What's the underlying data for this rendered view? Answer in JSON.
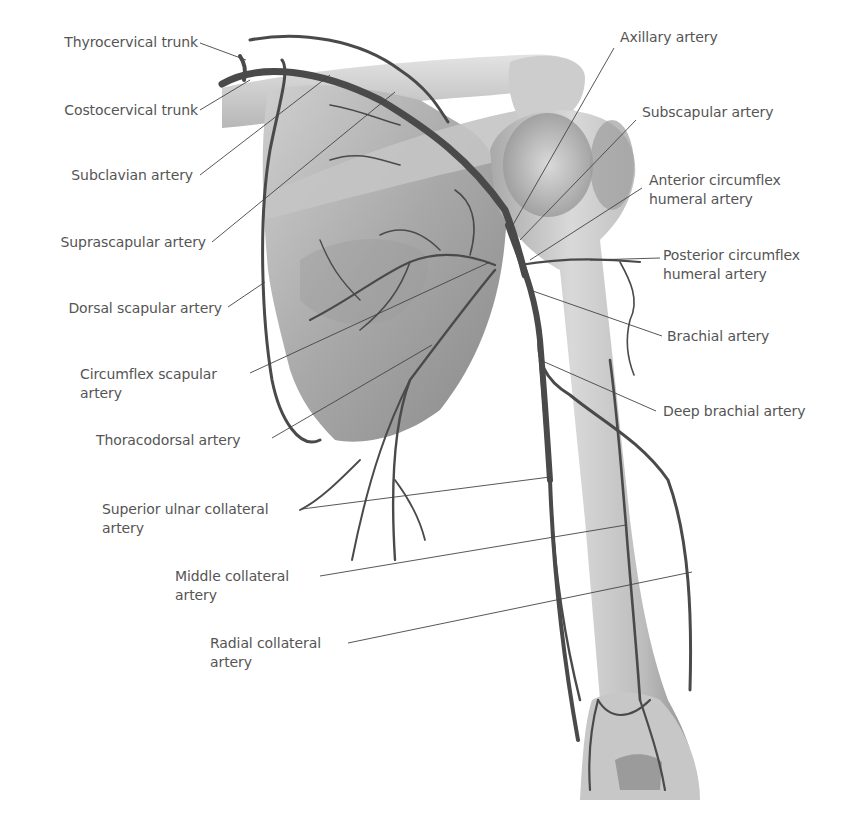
{
  "figure": {
    "colors": {
      "label_text": "#555555",
      "leader_line": "#444444",
      "artery": "#4a4a4a",
      "bone_light": "#d6d6d6",
      "bone_mid": "#b8b8b8",
      "bone_dark": "#8c8c8c",
      "background": "#ffffff"
    }
  },
  "labels": {
    "left": [
      {
        "id": "thyrocervical",
        "line1": "Thyrocervical trunk",
        "line2": ""
      },
      {
        "id": "costocervical",
        "line1": "Costocervical trunk",
        "line2": ""
      },
      {
        "id": "subclavian",
        "line1": "Subclavian artery",
        "line2": ""
      },
      {
        "id": "suprascapular",
        "line1": "Suprascapular artery",
        "line2": ""
      },
      {
        "id": "dorsal-scapular",
        "line1": "Dorsal scapular artery",
        "line2": ""
      },
      {
        "id": "circumflex-scapular",
        "line1": "Circumflex scapular",
        "line2": "artery"
      },
      {
        "id": "thoracodorsal",
        "line1": "Thoracodorsal artery",
        "line2": ""
      },
      {
        "id": "superior-ulnar-collateral",
        "line1": "Superior ulnar collateral",
        "line2": "artery"
      },
      {
        "id": "middle-collateral",
        "line1": "Middle collateral",
        "line2": "artery"
      },
      {
        "id": "radial-collateral",
        "line1": "Radial collateral",
        "line2": "artery"
      }
    ],
    "right": [
      {
        "id": "axillary",
        "line1": "Axillary artery",
        "line2": ""
      },
      {
        "id": "subscapular",
        "line1": "Subscapular artery",
        "line2": ""
      },
      {
        "id": "anterior-circumflex-humeral",
        "line1": "Anterior circumflex",
        "line2": "humeral artery"
      },
      {
        "id": "posterior-circumflex-humeral",
        "line1": "Posterior circumflex",
        "line2": "humeral artery"
      },
      {
        "id": "brachial",
        "line1": "Brachial artery",
        "line2": ""
      },
      {
        "id": "deep-brachial",
        "line1": "Deep brachial artery",
        "line2": ""
      }
    ]
  }
}
